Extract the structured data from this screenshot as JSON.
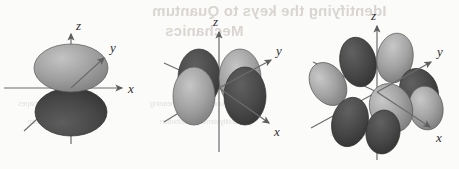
{
  "figure": {
    "kind": "atomic-orbital-diagram-set",
    "background_color": "#fbfbfa",
    "axis_color": "#6b6b6b",
    "lobe_light_color": "#9a9a9a",
    "lobe_dark_color": "#4a4a4a",
    "lobe_outline_color": "#3a3a3a",
    "panel_count": 3
  },
  "ghost_text": {
    "line1": "Identifying the keys to Quantum",
    "line2": "Mechanics",
    "line3": "the wave function and its meaning",
    "line4": "probability density distribution",
    "line5": "orbital shapes",
    "line6": "angular momentum",
    "line7": "quantum numbers"
  },
  "panels": [
    {
      "id": "panel-p-orbital",
      "name": "p-orbital",
      "lobe_count": 2,
      "axes": [
        {
          "name": "z",
          "label": "z",
          "direction": "up"
        },
        {
          "name": "y",
          "label": "y",
          "direction": "up-right"
        },
        {
          "name": "x",
          "label": "x",
          "direction": "right"
        }
      ],
      "lobes": [
        {
          "name": "upper-lobe",
          "shade": "light"
        },
        {
          "name": "lower-lobe",
          "shade": "dark"
        }
      ]
    },
    {
      "id": "panel-d-orbital",
      "name": "d-orbital",
      "lobe_count": 4,
      "axes": [
        {
          "name": "z",
          "label": "z",
          "direction": "up"
        },
        {
          "name": "y",
          "label": "y",
          "direction": "up-right"
        },
        {
          "name": "x",
          "label": "x",
          "direction": "down-right"
        }
      ],
      "lobes": [
        {
          "name": "back-left-lobe",
          "shade": "dark"
        },
        {
          "name": "front-left-lobe",
          "shade": "light"
        },
        {
          "name": "back-right-lobe",
          "shade": "light"
        },
        {
          "name": "front-right-lobe",
          "shade": "dark"
        }
      ]
    },
    {
      "id": "panel-f-orbital",
      "name": "f-orbital",
      "lobe_count": 8,
      "axes": [
        {
          "name": "z",
          "label": "z",
          "direction": "up"
        },
        {
          "name": "y",
          "label": "y",
          "direction": "up-right"
        },
        {
          "name": "x",
          "label": "x",
          "direction": "down-right"
        }
      ],
      "lobes": [
        {
          "name": "upper-back-left-lobe",
          "shade": "dark"
        },
        {
          "name": "upper-back-right-lobe",
          "shade": "light"
        },
        {
          "name": "upper-left-lobe",
          "shade": "light"
        },
        {
          "name": "mid-right-dark-lobe",
          "shade": "dark"
        },
        {
          "name": "mid-right-light-lobe",
          "shade": "light"
        },
        {
          "name": "lower-front-light-lobe",
          "shade": "light"
        },
        {
          "name": "lower-front-dark-lobe",
          "shade": "dark"
        },
        {
          "name": "lower-left-dark-lobe",
          "shade": "dark"
        }
      ]
    }
  ]
}
